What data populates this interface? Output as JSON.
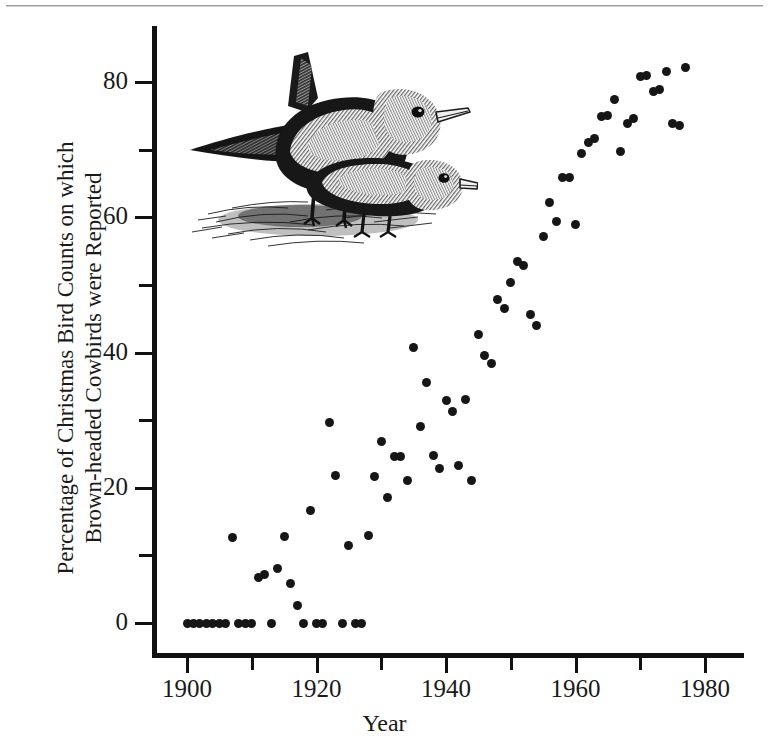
{
  "figure": {
    "illustration_alt": "two-cowbirds-illustration"
  },
  "chart_data": {
    "type": "scatter",
    "title": "",
    "xlabel": "Year",
    "ylabel": "Percentage of Christmas Bird Counts on which\nBrown-headed Cowbirds were Reported",
    "xlim": [
      1895,
      1987
    ],
    "ylim": [
      -6,
      88
    ],
    "grid": false,
    "legend": null,
    "x_major_ticks": [
      1900,
      1920,
      1940,
      1960,
      1980
    ],
    "x_minor_ticks": [
      1910,
      1930,
      1950,
      1970
    ],
    "y_major_ticks": [
      0,
      20,
      40,
      60,
      80
    ],
    "y_minor_ticks": [
      10,
      30,
      50,
      70
    ],
    "x_tick_labels": [
      "1900",
      "1920",
      "1940",
      "1960",
      "1980"
    ],
    "y_tick_labels": [
      "0",
      "20",
      "40",
      "60",
      "80"
    ],
    "marker": "filled-circle",
    "marker_color": "#161616",
    "point_count": 77,
    "points": [
      {
        "x": 1900,
        "y": 0
      },
      {
        "x": 1901,
        "y": 0
      },
      {
        "x": 1902,
        "y": 0
      },
      {
        "x": 1903,
        "y": 0
      },
      {
        "x": 1904,
        "y": 0
      },
      {
        "x": 1905,
        "y": 0
      },
      {
        "x": 1906,
        "y": 0
      },
      {
        "x": 1907,
        "y": 12.6
      },
      {
        "x": 1908,
        "y": 0
      },
      {
        "x": 1909,
        "y": 0
      },
      {
        "x": 1910,
        "y": 0
      },
      {
        "x": 1911,
        "y": 6.7
      },
      {
        "x": 1912,
        "y": 7.2
      },
      {
        "x": 1913,
        "y": 0
      },
      {
        "x": 1914,
        "y": 8.0
      },
      {
        "x": 1915,
        "y": 12.8
      },
      {
        "x": 1916,
        "y": 5.9
      },
      {
        "x": 1917,
        "y": 2.6
      },
      {
        "x": 1918,
        "y": 0
      },
      {
        "x": 1919,
        "y": 16.6
      },
      {
        "x": 1920,
        "y": 0
      },
      {
        "x": 1921,
        "y": 0
      },
      {
        "x": 1922,
        "y": 29.6
      },
      {
        "x": 1923,
        "y": 21.8
      },
      {
        "x": 1924,
        "y": 0
      },
      {
        "x": 1925,
        "y": 11.4
      },
      {
        "x": 1926,
        "y": 0
      },
      {
        "x": 1927,
        "y": 0
      },
      {
        "x": 1928,
        "y": 12.9
      },
      {
        "x": 1929,
        "y": 21.6
      },
      {
        "x": 1930,
        "y": 26.9
      },
      {
        "x": 1931,
        "y": 18.6
      },
      {
        "x": 1932,
        "y": 24.6
      },
      {
        "x": 1933,
        "y": 24.6
      },
      {
        "x": 1934,
        "y": 21.1
      },
      {
        "x": 1935,
        "y": 40.7
      },
      {
        "x": 1936,
        "y": 29.1
      },
      {
        "x": 1937,
        "y": 35.6
      },
      {
        "x": 1938,
        "y": 24.7
      },
      {
        "x": 1939,
        "y": 22.9
      },
      {
        "x": 1940,
        "y": 32.9
      },
      {
        "x": 1941,
        "y": 31.3
      },
      {
        "x": 1942,
        "y": 23.3
      },
      {
        "x": 1943,
        "y": 33.0
      },
      {
        "x": 1944,
        "y": 21.0
      },
      {
        "x": 1945,
        "y": 42.7
      },
      {
        "x": 1946,
        "y": 39.6
      },
      {
        "x": 1947,
        "y": 38.3
      },
      {
        "x": 1948,
        "y": 47.9
      },
      {
        "x": 1949,
        "y": 46.5
      },
      {
        "x": 1950,
        "y": 50.3
      },
      {
        "x": 1951,
        "y": 53.5
      },
      {
        "x": 1952,
        "y": 52.8
      },
      {
        "x": 1953,
        "y": 45.6
      },
      {
        "x": 1954,
        "y": 44.0
      },
      {
        "x": 1955,
        "y": 57.2
      },
      {
        "x": 1956,
        "y": 62.2
      },
      {
        "x": 1957,
        "y": 59.4
      },
      {
        "x": 1958,
        "y": 65.9
      },
      {
        "x": 1959,
        "y": 65.9
      },
      {
        "x": 1960,
        "y": 58.9
      },
      {
        "x": 1961,
        "y": 69.5
      },
      {
        "x": 1962,
        "y": 71.1
      },
      {
        "x": 1963,
        "y": 71.7
      },
      {
        "x": 1964,
        "y": 74.9
      },
      {
        "x": 1965,
        "y": 75.0
      },
      {
        "x": 1966,
        "y": 77.4
      },
      {
        "x": 1967,
        "y": 69.7
      },
      {
        "x": 1968,
        "y": 73.9
      },
      {
        "x": 1969,
        "y": 74.6
      },
      {
        "x": 1970,
        "y": 80.8
      },
      {
        "x": 1971,
        "y": 81.0
      },
      {
        "x": 1972,
        "y": 78.6
      },
      {
        "x": 1973,
        "y": 78.9
      },
      {
        "x": 1974,
        "y": 81.5
      },
      {
        "x": 1975,
        "y": 73.8
      },
      {
        "x": 1976,
        "y": 73.6
      },
      {
        "x": 1977,
        "y": 82.2
      }
    ]
  }
}
